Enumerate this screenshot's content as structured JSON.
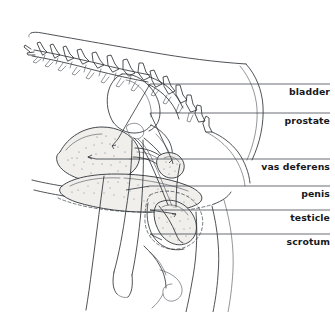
{
  "figure": {
    "type": "anatomical-line-diagram",
    "background_color": "#ffffff",
    "line_color": "#2f3338",
    "label_color": "#16181c",
    "width": 335,
    "height": 312
  },
  "labels": [
    {
      "id": "bladder",
      "text": "bladder",
      "text_x": 330,
      "text_y": 95,
      "leader_y": 84,
      "leader_x1": 150,
      "leader_x2": 330
    },
    {
      "id": "prostate",
      "text": "prostate",
      "text_x": 330,
      "text_y": 124,
      "leader_y": 113,
      "leader_x1": 150,
      "leader_x2": 330
    },
    {
      "id": "vas-deferens",
      "text": "vas deferens",
      "text_x": 330,
      "text_y": 170,
      "leader_y": 159,
      "leader_x1": 150,
      "leader_x2": 330
    },
    {
      "id": "penis",
      "text": "penis",
      "text_x": 330,
      "text_y": 197,
      "leader_y": 186,
      "leader_x1": 150,
      "leader_x2": 330
    },
    {
      "id": "testicle",
      "text": "testicle",
      "text_x": 330,
      "text_y": 221,
      "leader_y": 210,
      "leader_x1": 150,
      "leader_x2": 330
    },
    {
      "id": "scrotum",
      "text": "scrotum",
      "text_x": 330,
      "text_y": 245,
      "leader_y": 234,
      "leader_x1": 150,
      "leader_x2": 330
    }
  ],
  "structures": [
    {
      "name": "lumbar-spine",
      "description": "lumbar vertebrae with spinous processes"
    },
    {
      "name": "dorsal-body-contour",
      "description": "back outline"
    },
    {
      "name": "sacrum-pelvis",
      "description": "sacrum and pelvic bones"
    },
    {
      "name": "bladder-organ",
      "description": "urinary bladder, stippled oval"
    },
    {
      "name": "prostate-organ",
      "description": "prostate gland"
    },
    {
      "name": "vas-deferens-duct",
      "description": "ductus deferens"
    },
    {
      "name": "penis-shaft",
      "description": "penis, elongated stippled form"
    },
    {
      "name": "testicle-organ",
      "description": "testicle, stippled oval"
    },
    {
      "name": "scrotum-sac",
      "description": "scrotal sac, dashed outline"
    },
    {
      "name": "femur-bone",
      "description": "femur"
    },
    {
      "name": "hind-limb",
      "description": "hind limb outline"
    }
  ]
}
